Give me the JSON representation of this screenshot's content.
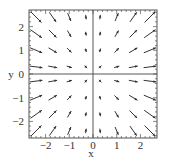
{
  "chart_data": {
    "type": "vector_field",
    "title": "",
    "xlabel": "x",
    "ylabel": "y",
    "xlim": [
      -2.7,
      2.7
    ],
    "ylim": [
      -2.7,
      2.7
    ],
    "field_description": "F(x,y) ≈ x·(x, y) — arrows point away from y-axis in right half and toward it (reversed radial) in left half",
    "grid_x": [
      -2.4,
      -1.7,
      -1.0,
      -0.3,
      0.3,
      1.0,
      1.7,
      2.4
    ],
    "grid_y": [
      2.4,
      1.7,
      1.0,
      0.3,
      -0.3,
      -1.0,
      -1.7,
      -2.4
    ],
    "xticks": [
      "-2",
      "-1",
      "0",
      "1",
      "2"
    ],
    "xtick_values": [
      -2,
      -1,
      0,
      1,
      2
    ],
    "yticks": [
      "2",
      "1",
      "0",
      "-1",
      "-2"
    ],
    "ytick_values": [
      2,
      1,
      0,
      -1,
      -2
    ],
    "axes_lines": true,
    "grid": false,
    "legend": null
  },
  "labels": {
    "x_axis": "x",
    "y_axis": "y"
  },
  "colors": {
    "arrow": "#333333",
    "frame": "#555555",
    "axis": "#444444"
  }
}
